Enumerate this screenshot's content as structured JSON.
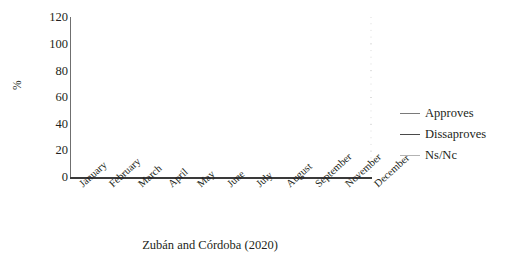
{
  "caption": "Zubán and Córdoba (2020)",
  "chart_data": {
    "type": "line",
    "title": "",
    "xlabel": "",
    "ylabel": "%",
    "ylim": [
      0,
      120
    ],
    "ytick_step": 20,
    "yticks": [
      "120",
      "100",
      "80",
      "60",
      "40",
      "20",
      "0"
    ],
    "grid": true,
    "grid_minor_step": 5,
    "legend_position": "right",
    "categories": [
      "January",
      "February",
      "March",
      "April",
      "May",
      "June",
      "July",
      "August",
      "September",
      "November",
      "December"
    ],
    "series": [
      {
        "name": "Approves",
        "color": "#7a7a7a",
        "values": [
          60,
          62,
          97,
          90,
          83,
          72,
          66,
          60,
          54,
          56,
          48
        ]
      },
      {
        "name": "Dissaproves",
        "color": "#4a4a4a",
        "values": [
          29,
          29,
          2,
          10,
          18,
          26,
          35,
          40,
          44,
          44,
          49
        ]
      },
      {
        "name": "Ns/Nc",
        "color": "#b3b3b3",
        "values": [
          13,
          12,
          2,
          2,
          2,
          2,
          3,
          3,
          4,
          5,
          6
        ]
      }
    ]
  }
}
